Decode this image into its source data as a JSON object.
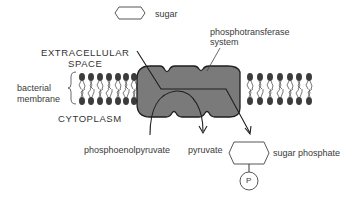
{
  "labels": {
    "sugar": "sugar",
    "phosphotransferase_line1": "phosphotransferase",
    "phosphotransferase_line2": "system",
    "extracellular_line1": "EXTRACELLULAR",
    "extracellular_line2": "SPACE",
    "bacterial_line1": "bacterial",
    "bacterial_line2": "membrane",
    "cytoplasm": "CYTOPLASM",
    "phosphoenolpyruvate": "phosphoenolpyruvate",
    "pyruvate": "pyruvate",
    "sugar_phosphate": "sugar phosphate",
    "phosphate_symbol": "P"
  },
  "colors": {
    "protein_fill": "#7a7a7a",
    "outline": "#1e1e1e",
    "lipid_head": "#3c3c3c",
    "text": "#333333"
  }
}
